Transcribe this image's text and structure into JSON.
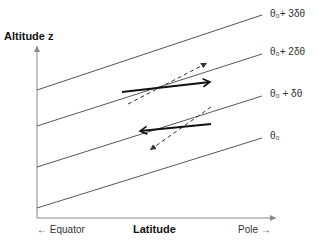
{
  "diagram": {
    "y_axis_label": "Altitude z",
    "x_axis_label": "Latitude",
    "x_left_label": "← Equator",
    "x_right_label": "Pole →",
    "isentropes": [
      {
        "label": "θ₀+ 3δθ"
      },
      {
        "label": "θ₀+ 2δθ"
      },
      {
        "label": "θ₀ + δθ"
      },
      {
        "label": "θ₀"
      }
    ],
    "arrows": [
      {
        "name": "upper-solid-arrow",
        "direction": "poleward"
      },
      {
        "name": "upper-dashed-arrow",
        "direction": "poleward-upward"
      },
      {
        "name": "lower-solid-arrow",
        "direction": "equatorward"
      },
      {
        "name": "lower-dashed-arrow",
        "direction": "equatorward-downward"
      }
    ]
  }
}
